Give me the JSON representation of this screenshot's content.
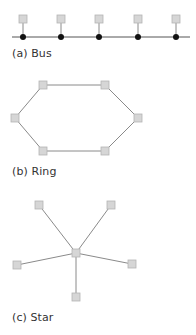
{
  "colors": {
    "node_fill": "#d6d6d6",
    "node_stroke": "#b4b4b4",
    "link": "#8a8a8a",
    "bus_line": "#555555",
    "bus_tap": "#111111",
    "label": "#333333"
  },
  "diagrams": [
    {
      "id": "bus",
      "label": "(a) Bus",
      "label_pos": [
        12,
        47
      ],
      "backbone": [
        [
          12,
          37
        ],
        [
          190,
          37
        ]
      ],
      "nodes": [
        [
          23,
          19
        ],
        [
          61,
          19
        ],
        [
          99,
          19
        ],
        [
          138,
          19
        ],
        [
          176,
          19
        ]
      ],
      "taps": [
        [
          23,
          37
        ],
        [
          61,
          37
        ],
        [
          99,
          37
        ],
        [
          138,
          37
        ],
        [
          176,
          37
        ]
      ]
    },
    {
      "id": "ring",
      "label": "(b) Ring",
      "label_pos": [
        12,
        165
      ],
      "nodes": [
        [
          43,
          85
        ],
        [
          105,
          85
        ],
        [
          138,
          118
        ],
        [
          105,
          151
        ],
        [
          43,
          151
        ],
        [
          15,
          118
        ]
      ]
    },
    {
      "id": "star",
      "label": "(c) Star",
      "label_pos": [
        12,
        311
      ],
      "hub": [
        76,
        253
      ],
      "nodes": [
        [
          39,
          205
        ],
        [
          111,
          205
        ],
        [
          132,
          264
        ],
        [
          76,
          297
        ],
        [
          17,
          265
        ]
      ]
    }
  ]
}
